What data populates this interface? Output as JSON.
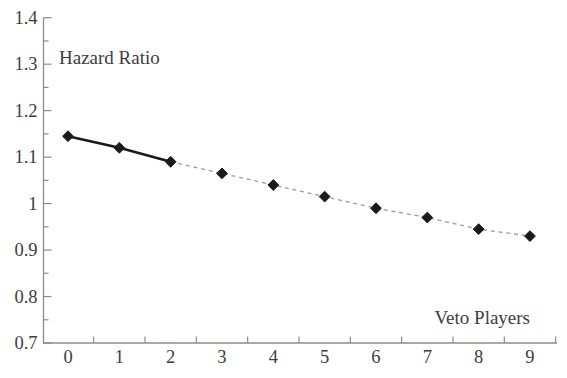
{
  "page": {
    "background": "#ffffff"
  },
  "chart_data": {
    "type": "line",
    "title": "",
    "ylabel": "Hazard Ratio",
    "xlabel": "Veto Players",
    "x": [
      0,
      1,
      2,
      3,
      4,
      5,
      6,
      7,
      8,
      9
    ],
    "series": [
      {
        "name": "Hazard Ratio",
        "values": [
          1.145,
          1.12,
          1.09,
          1.065,
          1.04,
          1.015,
          0.99,
          0.97,
          0.945,
          0.93
        ]
      }
    ],
    "segments": [
      {
        "from": 0,
        "to": 2,
        "style": "solid"
      },
      {
        "from": 2,
        "to": 9,
        "style": "dashed"
      }
    ],
    "marker": "diamond",
    "xlim": [
      -0.5,
      9.5
    ],
    "ylim": [
      0.7,
      1.4
    ],
    "grid": false,
    "legend": "none",
    "x_tick_labels": [
      "0",
      "1",
      "2",
      "3",
      "4",
      "5",
      "6",
      "7",
      "8",
      "9"
    ],
    "x_minor_ticks": [
      0.5,
      1.5,
      2.5,
      3.5,
      4.5,
      5.5,
      6.5,
      7.5,
      8.5,
      9.5
    ],
    "y_ticks": [
      {
        "value": 1.4,
        "label": "1.4"
      },
      {
        "value": 1.3,
        "label": "1.3"
      },
      {
        "value": 1.2,
        "label": "1.2"
      },
      {
        "value": 1.1,
        "label": "1.1"
      },
      {
        "value": 1.0,
        "label": "1"
      },
      {
        "value": 0.9,
        "label": "0.9"
      },
      {
        "value": 0.8,
        "label": "0.8"
      },
      {
        "value": 0.7,
        "label": "0.7"
      }
    ],
    "y_minor_step": 0.05,
    "colors": {
      "solid_line": "#1a1a1a",
      "dashed_line": "#9b9b9b",
      "marker": "#1a1a1a",
      "axis": "#8c8c88",
      "text": "#3d3d3d"
    }
  }
}
